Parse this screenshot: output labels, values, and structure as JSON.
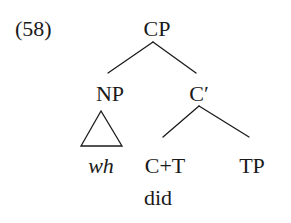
{
  "example": {
    "number": "(58)"
  },
  "tree": {
    "root": {
      "label": "CP",
      "children": [
        {
          "label": "NP",
          "triangle": true,
          "yield": "wh",
          "yield_style": "italic"
        },
        {
          "label": "C′",
          "children": [
            {
              "label": "C+T",
              "lexical": "did"
            },
            {
              "label": "TP"
            }
          ]
        }
      ]
    },
    "nodes": {
      "cp": "CP",
      "np": "NP",
      "c_bar": "C′",
      "wh": "wh",
      "c_t": "C+T",
      "did": "did",
      "tp": "TP"
    }
  }
}
